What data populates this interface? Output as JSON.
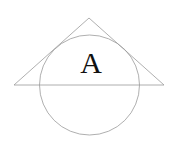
{
  "diagram": {
    "label": "A",
    "colors": {
      "background": "#ffffff",
      "stroke": "#9a9a9a",
      "label": "#111111"
    },
    "triangle": {
      "apex": [
        89,
        18
      ],
      "base_left": [
        14,
        85
      ],
      "base_right": [
        164,
        85
      ]
    },
    "circle": {
      "center": [
        89.5,
        85
      ],
      "radius": 50
    }
  }
}
